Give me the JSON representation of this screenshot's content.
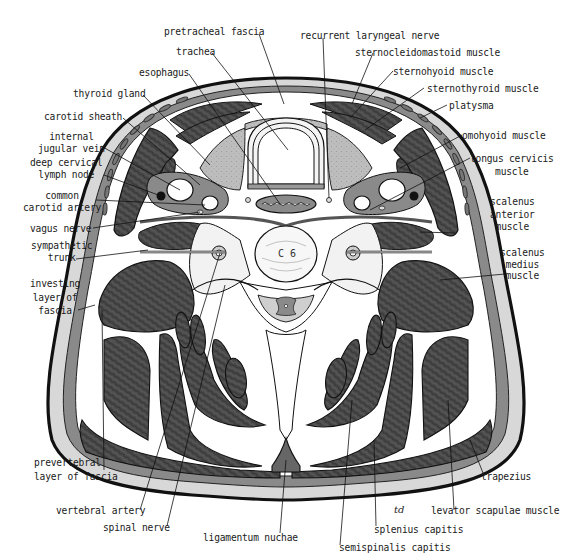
{
  "figure": {
    "vertebra_label": "C 6",
    "artist_signature": "td",
    "colors": {
      "muscle": "#4a4a4a",
      "fascia": "#8a8a8a",
      "skin_fat": "#d8d8d8",
      "outline": "#111111",
      "gland": "#bdbdbd",
      "background": "#ffffff"
    }
  },
  "labels": {
    "pretracheal_fascia": "pretracheal fascia",
    "trachea": "trachea",
    "esophagus": "esophagus",
    "thyroid_gland": "thyroid gland",
    "carotid_sheath": "carotid sheath",
    "internal_jugular_vein": "internal\njugular vein",
    "deep_cervical_lymph_node": "deep cervical\nlymph node",
    "common_carotid_artery": "common\ncarotid artery",
    "vagus_nerve": "vagus nerve",
    "sympathetic_trunk": "sympathetic\ntrunk",
    "investing_layer_of_fascia": "investing\nlayer of\nfascia",
    "prevertebral_layer_of_fascia": "prevertebral\nlayer of fascia",
    "vertebral_artery": "vertebral artery",
    "spinal_nerve": "spinal nerve",
    "ligamentum_nuchae": "ligamentum nuchae",
    "semispinalis_capitis": "semispinalis capitis",
    "splenius_capitis": "splenius capitis",
    "levator_scapulae_muscle": "levator scapulae muscle",
    "trapezius": "trapezius",
    "scalenus_medius_muscle": "scalenus\nmedius\nmuscle",
    "scalenus_anterior_muscle": "scalenus\nanterior\nmuscle",
    "longus_cervicis_muscle": "longus cervicis\nmuscle",
    "omohyoid_muscle": "omohyoid muscle",
    "platysma": "platysma",
    "sternothyroid_muscle": "sternothyroid muscle",
    "sternohyoid_muscle": "sternohyoid muscle",
    "sternocleidomastoid_muscle": "sternocleidomastoid muscle",
    "recurrent_laryngeal_nerve": "recurrent laryngeal nerve"
  }
}
